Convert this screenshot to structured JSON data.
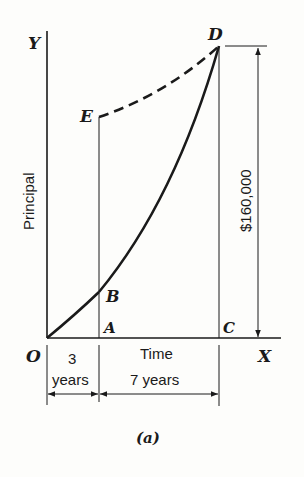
{
  "figure": {
    "caption": "(a)",
    "axes": {
      "y_label": "Y",
      "x_label": "X",
      "y_title": "Principal",
      "x_title": "Time",
      "origin_label": "O"
    },
    "points": {
      "A": "A",
      "B": "B",
      "C": "C",
      "D": "D",
      "E": "E"
    },
    "dimension": {
      "amount": "$160,000"
    },
    "intervals": [
      {
        "line1": "3",
        "line2": "years"
      },
      {
        "line1": "7 years"
      }
    ],
    "colors": {
      "ink": "#1a1a1a",
      "background": "#fdfdfb"
    }
  }
}
